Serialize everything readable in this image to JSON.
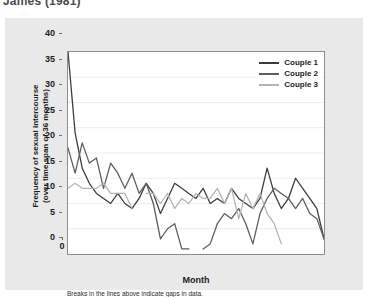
{
  "citation": "James (1981)",
  "chart_data": {
    "type": "line",
    "title": "",
    "xlabel": "Month",
    "ylabel": "Frequency of sexual intercourse (over time span of 36 months)",
    "ylabel_lines": [
      "Frequency of sexual intercourse",
      "(over time span of 36 months)"
    ],
    "note": "Breaks in the lines above indicate gaps in data.",
    "xlim": [
      0,
      36
    ],
    "ylim": [
      0,
      40
    ],
    "xticks": [
      0,
      5,
      10,
      15,
      20,
      25,
      30,
      35
    ],
    "yticks": [
      0,
      5,
      10,
      15,
      20,
      25,
      30,
      35,
      40
    ],
    "grid": "horizontal-faint",
    "legend_position": "top-right-inside",
    "series": [
      {
        "name": "Couple 1",
        "color": "#3c3c3c",
        "segments": [
          {
            "x": [
              0,
              1,
              2,
              3,
              4,
              5,
              6,
              7,
              8,
              9,
              10,
              11,
              12,
              13,
              14,
              15,
              16,
              17,
              18,
              19,
              20,
              21,
              22,
              23,
              24,
              25,
              26,
              27,
              28,
              29,
              30,
              31,
              32,
              33,
              34,
              35,
              36
            ],
            "y": [
              40,
              24,
              17,
              14,
              12,
              11,
              10,
              12,
              10,
              9,
              11,
              14,
              12,
              8,
              11,
              14,
              13,
              12,
              11,
              13,
              10,
              11,
              10,
              13,
              11,
              10,
              9,
              11,
              17,
              12,
              9,
              11,
              15,
              13,
              11,
              9,
              3
            ]
          }
        ]
      },
      {
        "name": "Couple 2",
        "color": "#5d5d5d",
        "segments": [
          {
            "x": [
              0,
              1,
              2,
              3,
              4,
              5,
              6,
              7,
              8,
              9,
              10,
              11,
              12,
              13,
              14,
              15,
              16,
              17
            ],
            "y": [
              21,
              16,
              22,
              18,
              19,
              13,
              18,
              16,
              13,
              16,
              12,
              14,
              10,
              3,
              5,
              6,
              1,
              1
            ]
          },
          {
            "x": [
              19,
              20,
              21,
              22,
              23,
              24,
              25,
              26,
              27,
              28,
              29,
              30,
              31,
              32,
              33,
              34,
              35,
              36
            ],
            "y": [
              1,
              2,
              6,
              8,
              7,
              9,
              6,
              2,
              8,
              11,
              13,
              12,
              11,
              9,
              11,
              8,
              7,
              3
            ]
          }
        ]
      },
      {
        "name": "Couple 3",
        "color": "#b4b4b4",
        "segments": [
          {
            "x": [
              0,
              1,
              2,
              3,
              4,
              5,
              6,
              7,
              8,
              9
            ],
            "y": [
              13,
              14,
              13,
              13,
              13,
              14,
              12,
              12,
              12,
              9
            ]
          },
          {
            "x": [
              11,
              12,
              13,
              14,
              15,
              16,
              17,
              18,
              19,
              20,
              21,
              22,
              23,
              24,
              25,
              26
            ],
            "y": [
              12,
              12,
              10,
              12,
              9,
              11,
              10,
              12,
              11,
              11,
              13,
              10,
              13,
              7,
              12,
              9
            ]
          },
          {
            "x": [
              26,
              27,
              28,
              29,
              30
            ],
            "y": [
              9,
              12,
              8,
              6,
              2
            ]
          }
        ]
      }
    ]
  },
  "legend": {
    "items": [
      {
        "label": "Couple 1",
        "color": "#3c3c3c"
      },
      {
        "label": "Couple 2",
        "color": "#5d5d5d"
      },
      {
        "label": "Couple 3",
        "color": "#b4b4b4"
      }
    ]
  }
}
